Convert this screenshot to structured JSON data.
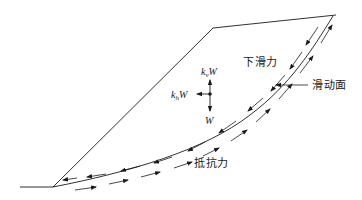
{
  "diagram": {
    "type": "slope-stability-force-diagram",
    "labels": {
      "sliding_force": "下滑力",
      "slip_surface": "滑动面",
      "resisting_force": "抵抗力",
      "vertical_seismic": {
        "k": "k",
        "sub": "v",
        "w": "W"
      },
      "horizontal_seismic": {
        "k": "k",
        "sub": "h",
        "w": "W"
      },
      "weight": "W"
    },
    "colors": {
      "line": "#1a1a1a",
      "background": "#ffffff"
    }
  }
}
